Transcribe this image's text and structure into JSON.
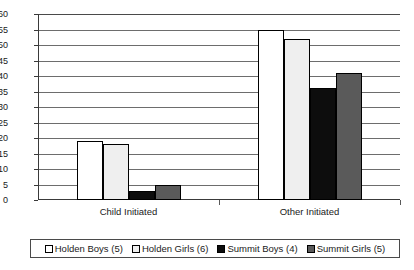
{
  "chart_data": {
    "type": "bar",
    "title": "",
    "subtitle": "",
    "xlabel": "",
    "ylabel": "",
    "categories": [
      "Child Initiated",
      "Other Initiated"
    ],
    "series": [
      {
        "name": "Holden Boys (5)",
        "values": [
          19,
          55
        ],
        "fill": "white",
        "color": "#ffffff"
      },
      {
        "name": "Holden Girls (6)",
        "values": [
          18,
          52
        ],
        "fill": "dots",
        "color": "#efefef"
      },
      {
        "name": "Summit Boys (4)",
        "values": [
          3,
          36
        ],
        "fill": "black",
        "color": "#0d0d0d"
      },
      {
        "name": "Summit Girls (5)",
        "values": [
          5,
          41
        ],
        "fill": "gray",
        "color": "#5a5a5a"
      }
    ],
    "ylim": [
      0,
      60
    ],
    "ytick_step": 5,
    "yticks": [
      60,
      55,
      50,
      45,
      40,
      35,
      30,
      25,
      20,
      15,
      10,
      5,
      0
    ],
    "grid": true,
    "legend_position": "bottom"
  },
  "legend": {
    "items": [
      {
        "label": "Holden Boys (5)"
      },
      {
        "label": "Holden Girls (6)"
      },
      {
        "label": "Summit Boys (4)"
      },
      {
        "label": "Summit Girls (5)"
      }
    ]
  },
  "axis": {
    "x_labels": [
      "Child Initiated",
      "Other Initiated"
    ]
  }
}
